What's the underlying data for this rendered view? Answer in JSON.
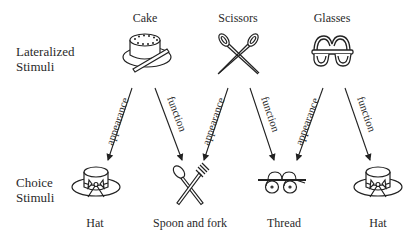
{
  "row_labels": {
    "lateralized": [
      "Lateralized",
      "Stimuli"
    ],
    "choice": [
      "Choice",
      "Stimuli"
    ]
  },
  "lateralized_stimuli": [
    {
      "label": "Cake",
      "icon": "cake-icon"
    },
    {
      "label": "Scissors",
      "icon": "scissors-icon"
    },
    {
      "label": "Glasses",
      "icon": "glasses-icon"
    }
  ],
  "choice_stimuli": [
    {
      "label": "Hat",
      "icon": "hat-icon"
    },
    {
      "label": "Spoon and fork",
      "icon": "spoon-fork-icon"
    },
    {
      "label": "Thread",
      "icon": "thread-icon"
    },
    {
      "label": "Hat",
      "icon": "hat-icon"
    }
  ],
  "arrows": [
    {
      "from": "Cake",
      "to": "Hat",
      "label": "appearance"
    },
    {
      "from": "Cake",
      "to": "Spoon and fork",
      "label": "function"
    },
    {
      "from": "Scissors",
      "to": "Spoon and fork",
      "label": "appearance"
    },
    {
      "from": "Scissors",
      "to": "Thread",
      "label": "function"
    },
    {
      "from": "Glasses",
      "to": "Thread",
      "label": "appearance"
    },
    {
      "from": "Glasses",
      "to": "Hat",
      "label": "function"
    }
  ]
}
